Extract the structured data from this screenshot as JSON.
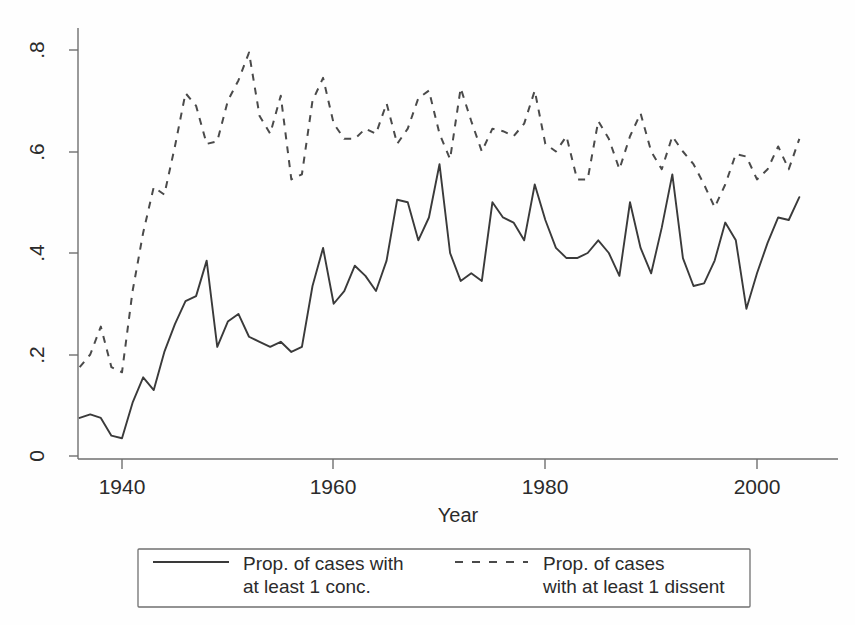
{
  "chart_data": {
    "type": "line",
    "title": "",
    "xlabel": "Year",
    "ylabel": "",
    "xlim": [
      1936,
      2005
    ],
    "ylim": [
      0,
      0.85
    ],
    "grid": false,
    "legend_position": "bottom",
    "xticks": [
      1940,
      1960,
      1980,
      2000
    ],
    "xtick_labels": [
      "1940",
      "1960",
      "1980",
      "2000"
    ],
    "yticks": [
      0,
      0.2,
      0.4,
      0.6,
      0.8
    ],
    "ytick_labels": [
      "0",
      ".2",
      ".4",
      ".6",
      ".8"
    ],
    "x": [
      1936,
      1937,
      1938,
      1939,
      1940,
      1941,
      1942,
      1943,
      1944,
      1945,
      1946,
      1947,
      1948,
      1949,
      1950,
      1951,
      1952,
      1953,
      1954,
      1955,
      1956,
      1957,
      1958,
      1959,
      1960,
      1961,
      1962,
      1963,
      1964,
      1965,
      1966,
      1967,
      1968,
      1969,
      1970,
      1971,
      1972,
      1973,
      1974,
      1975,
      1976,
      1977,
      1978,
      1979,
      1980,
      1981,
      1982,
      1983,
      1984,
      1985,
      1986,
      1987,
      1988,
      1989,
      1990,
      1991,
      1992,
      1993,
      1994,
      1995,
      1996,
      1997,
      1998,
      1999,
      2000,
      2001,
      2002,
      2003,
      2004
    ],
    "series": [
      {
        "name": "Prop. of cases with at least 1 conc.",
        "style": "solid",
        "color": "#3a3a3a",
        "values": [
          0.075,
          0.082,
          0.075,
          0.04,
          0.035,
          0.105,
          0.155,
          0.13,
          0.205,
          0.26,
          0.305,
          0.315,
          0.385,
          0.215,
          0.265,
          0.28,
          0.235,
          0.225,
          0.215,
          0.225,
          0.205,
          0.215,
          0.335,
          0.41,
          0.3,
          0.325,
          0.375,
          0.355,
          0.325,
          0.385,
          0.505,
          0.5,
          0.425,
          0.47,
          0.575,
          0.4,
          0.345,
          0.36,
          0.345,
          0.5,
          0.47,
          0.46,
          0.425,
          0.535,
          0.465,
          0.41,
          0.39,
          0.39,
          0.4,
          0.425,
          0.4,
          0.355,
          0.5,
          0.41,
          0.36,
          0.45,
          0.555,
          0.39,
          0.335,
          0.34,
          0.385,
          0.46,
          0.425,
          0.29,
          0.36,
          0.42,
          0.47,
          0.465,
          0.51
        ]
      },
      {
        "name": "Prop. of cases with at least 1 dissent",
        "style": "dashed",
        "color": "#4a4a4a",
        "values": [
          0.175,
          0.2,
          0.255,
          0.175,
          0.165,
          0.325,
          0.44,
          0.53,
          0.515,
          0.61,
          0.715,
          0.69,
          0.615,
          0.62,
          0.7,
          0.74,
          0.795,
          0.67,
          0.635,
          0.71,
          0.545,
          0.555,
          0.7,
          0.745,
          0.655,
          0.625,
          0.625,
          0.645,
          0.635,
          0.695,
          0.615,
          0.645,
          0.705,
          0.72,
          0.635,
          0.585,
          0.725,
          0.66,
          0.6,
          0.645,
          0.64,
          0.63,
          0.655,
          0.72,
          0.615,
          0.6,
          0.63,
          0.545,
          0.545,
          0.66,
          0.625,
          0.565,
          0.63,
          0.675,
          0.6,
          0.565,
          0.63,
          0.6,
          0.575,
          0.535,
          0.49,
          0.535,
          0.595,
          0.59,
          0.545,
          0.565,
          0.61,
          0.565,
          0.625
        ]
      }
    ],
    "legend": [
      {
        "label_line1": "Prop. of cases with",
        "label_line2": "at least 1 conc.",
        "style": "solid"
      },
      {
        "label_line1": "Prop. of cases",
        "label_line2": "with at least 1 dissent",
        "style": "dashed"
      }
    ]
  },
  "axes": {
    "x_title": "Year",
    "x_tick_1": "1940",
    "x_tick_2": "1960",
    "x_tick_3": "1980",
    "x_tick_4": "2000",
    "y_tick_1": "0",
    "y_tick_2": ".2",
    "y_tick_3": ".4",
    "y_tick_4": ".6",
    "y_tick_5": ".8"
  },
  "legend": {
    "series1_line1": "Prop. of cases with",
    "series1_line2": "at least 1 conc.",
    "series2_line1": "Prop. of cases",
    "series2_line2": "with at least 1 dissent"
  },
  "colors": {
    "solid_series": "#3a3a3a",
    "dashed_series": "#4a4a4a",
    "axis": "#6f6f6f",
    "background": "#ffffff"
  }
}
